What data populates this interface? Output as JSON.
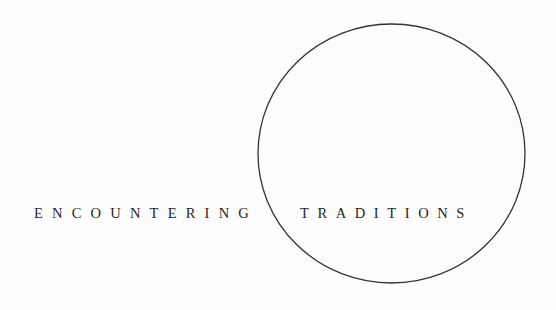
{
  "title": {
    "word_left": "ENCOUNTERING",
    "word_right": "TRADITIONS"
  },
  "graphic": {
    "shape": "circle-outline",
    "stroke_color": "#333333",
    "background_color": "#fdfdfd",
    "text_color": "#262626"
  }
}
